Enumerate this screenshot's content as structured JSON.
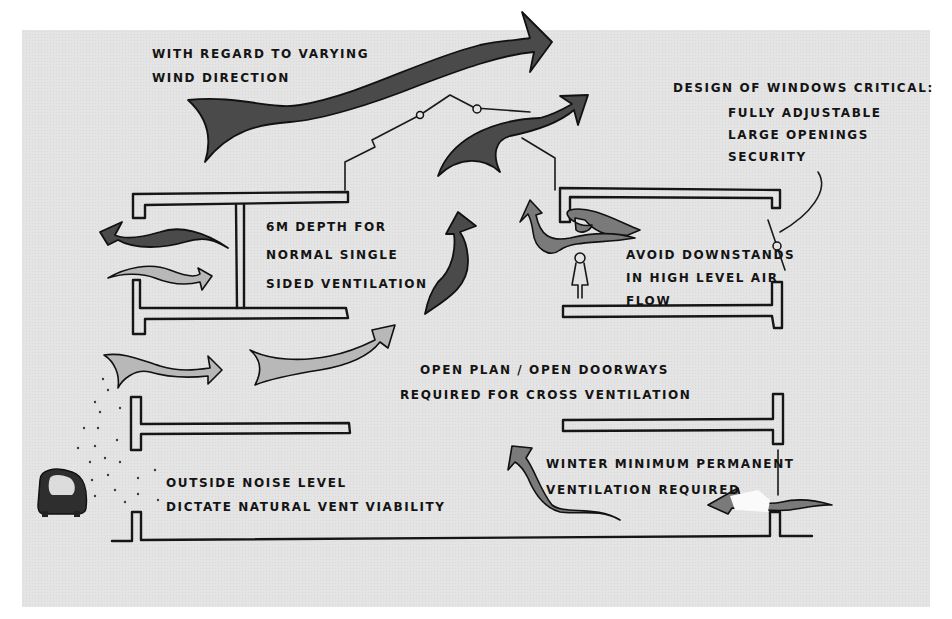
{
  "diagram": {
    "type": "section-sketch",
    "colors": {
      "paper": "#e4e4e4",
      "ink": "#161616",
      "border": "#ffffff"
    }
  },
  "annotations": {
    "wind_direction": {
      "lines": [
        "With regard to varying",
        "wind direction"
      ]
    },
    "windows": {
      "heading": "Design of windows critical:",
      "items": [
        "Fully adjustable",
        "large openings",
        "security"
      ]
    },
    "depth": {
      "lines": [
        "6m depth for",
        "normal single",
        "sided ventilation"
      ]
    },
    "downstands": {
      "lines": [
        "Avoid downstands",
        "in high level air",
        "flow"
      ]
    },
    "cross_ventilation": {
      "lines": [
        "Open plan / open doorways",
        "required for cross ventilation"
      ]
    },
    "noise": {
      "lines": [
        "Outside noise level",
        "dictate natural vent viability"
      ]
    },
    "winter": {
      "lines": [
        "Winter minimum permanent",
        "ventilation required"
      ]
    }
  },
  "elements": {
    "icons": [
      "wind-arrow-icon",
      "roof-vent-window-icon",
      "airflow-arrow-icon",
      "person-figure-icon",
      "vehicle-noise-source-icon",
      "pivot-window-icon"
    ]
  }
}
